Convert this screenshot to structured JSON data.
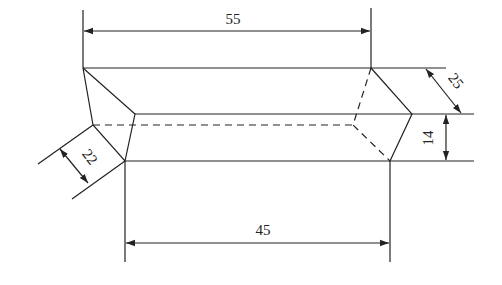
{
  "diagram": {
    "type": "technical-drawing",
    "dimensions": {
      "top_length": "55",
      "bottom_length": "45",
      "slant_width_right": "25",
      "height_right": "14",
      "slant_width_left": "22"
    },
    "colors": {
      "line": "#222222",
      "background": "#ffffff"
    }
  }
}
